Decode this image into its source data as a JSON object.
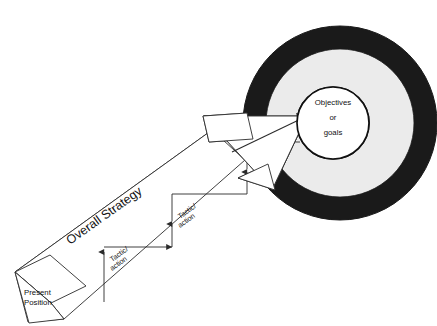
{
  "diagram": {
    "type": "strategy-arrow-to-target",
    "colors": {
      "outer_ring": "#1a1a1a",
      "middle_ring": "#ebebeb",
      "inner_circle": "#ffffff",
      "stroke": "#2b2b2b",
      "text": "#111111",
      "background": "#ffffff"
    },
    "target": {
      "label_line1": "Objectives",
      "label_line2": "or",
      "label_line3": "goals"
    },
    "start_block": {
      "label_line1": "Present",
      "label_line2": "Position"
    },
    "strategy_arrow": {
      "label": "Overall Strategy"
    },
    "steps": [
      {
        "label_line1": "Tactic/",
        "label_line2": "action"
      },
      {
        "label_line1": "Tactic/",
        "label_line2": "action"
      },
      {
        "label_line1": "Tactic/",
        "label_line2": "action"
      }
    ]
  }
}
